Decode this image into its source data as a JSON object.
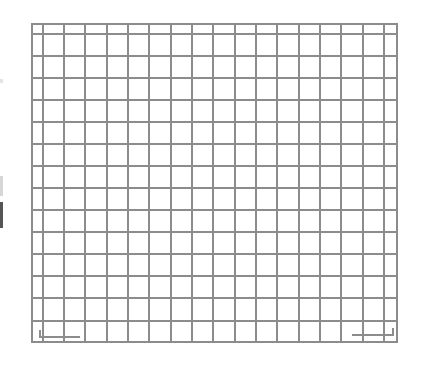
{
  "canvas": {
    "width": 423,
    "height": 374,
    "background": "#ffffff"
  },
  "grid": {
    "line_color": "#8c8c8c",
    "line_width": 2,
    "left": 32,
    "top": 24,
    "right": 397,
    "bottom": 342,
    "vertical_lines": [
      43,
      64,
      85,
      107,
      128,
      149,
      171,
      192,
      213,
      235,
      256,
      277,
      299,
      320,
      341,
      363,
      384
    ],
    "horizontal_lines": [
      34,
      56,
      78,
      100,
      122,
      144,
      166,
      188,
      210,
      232,
      254,
      276,
      298,
      321
    ],
    "columns": 18,
    "rows": 15
  },
  "corner_marks": {
    "bottom_left": {
      "x1": 40,
      "y_top": 330,
      "x2": 80,
      "y_bottom": 337
    },
    "bottom_right": {
      "x1": 352,
      "y_top": 328,
      "x2": 393,
      "y_bottom": 335
    }
  },
  "edge_marks": [
    {
      "name": "faint-mark",
      "top": 79,
      "height": 4
    },
    {
      "name": "light-bar",
      "top": 176,
      "height": 20
    },
    {
      "name": "dark-bar",
      "top": 202,
      "height": 26
    }
  ]
}
